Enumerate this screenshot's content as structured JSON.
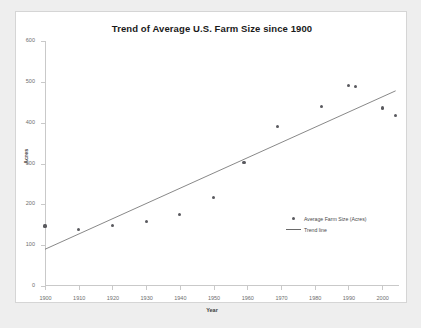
{
  "chart_data": {
    "type": "scatter",
    "title": "Trend of Average U.S. Farm Size since 1900",
    "xlabel": "Year",
    "ylabel": "Acres",
    "xlim": [
      1900,
      2005
    ],
    "ylim": [
      0,
      600
    ],
    "xticks": [
      1900,
      1910,
      1920,
      1930,
      1940,
      1950,
      1960,
      1970,
      1980,
      1990,
      2000
    ],
    "yticks": [
      0,
      100,
      200,
      300,
      400,
      500,
      600
    ],
    "grid": false,
    "legend_position": "inside-lower-right",
    "series": [
      {
        "name": "Average Farm Size (Acres)",
        "type": "scatter",
        "marker": "circle",
        "color": "#59595e",
        "points": [
          {
            "x": 1900,
            "y": 147
          },
          {
            "x": 1910,
            "y": 138
          },
          {
            "x": 1920,
            "y": 149
          },
          {
            "x": 1930,
            "y": 157
          },
          {
            "x": 1940,
            "y": 175
          },
          {
            "x": 1950,
            "y": 216
          },
          {
            "x": 1959,
            "y": 303
          },
          {
            "x": 1969,
            "y": 390
          },
          {
            "x": 1982,
            "y": 440
          },
          {
            "x": 1990,
            "y": 491
          },
          {
            "x": 1992,
            "y": 489
          },
          {
            "x": 2000,
            "y": 436
          },
          {
            "x": 2004,
            "y": 418
          }
        ]
      },
      {
        "name": "Trend line",
        "type": "line",
        "color": "#6a6a6a",
        "endpoints": [
          {
            "x": 1900,
            "y": 90
          },
          {
            "x": 2004,
            "y": 478
          }
        ]
      }
    ]
  }
}
